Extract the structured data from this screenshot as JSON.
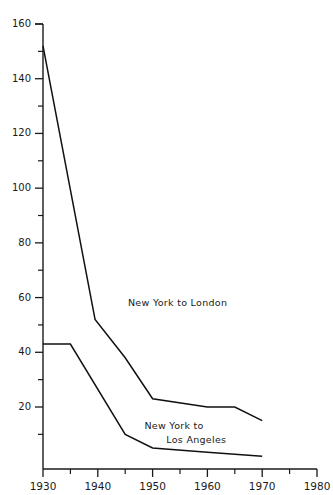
{
  "chart_data": {
    "type": "line",
    "title": "",
    "subtitle": "",
    "xlabel": "",
    "ylabel": "",
    "xlim": [
      1930,
      1980
    ],
    "ylim": [
      0,
      160
    ],
    "grid": false,
    "legend_position": "inline-annotation",
    "x_major_ticks": [
      1930,
      1940,
      1950,
      1960,
      1970,
      1980
    ],
    "x_minor_ticks": [
      1935,
      1945,
      1955,
      1965,
      1975
    ],
    "x_tick_labels": [
      "1930",
      "1940",
      "1950",
      "1960",
      "1970",
      "1980"
    ],
    "y_major_ticks": [
      20,
      40,
      60,
      80,
      100,
      120,
      140,
      160
    ],
    "y_minor_ticks": [
      10,
      30,
      50,
      70,
      90,
      110,
      130,
      150
    ],
    "y_tick_labels": [
      "20",
      "40",
      "60",
      "80",
      "100",
      "120",
      "140",
      "160"
    ],
    "series": [
      {
        "name": "New York to London",
        "label_lines": [
          "New York to London"
        ],
        "color": "#111111",
        "x": [
          1930,
          1939.5,
          1945,
          1950,
          1960,
          1965,
          1970
        ],
        "values": [
          152,
          52,
          38,
          23,
          20,
          20,
          15
        ]
      },
      {
        "name": "New York to Los Angeles",
        "label_lines": [
          "New York to",
          "Los Angeles"
        ],
        "color": "#111111",
        "x": [
          1930,
          1935,
          1945,
          1950,
          1960,
          1970
        ],
        "values": [
          43,
          43,
          10,
          5,
          3.5,
          2
        ]
      }
    ],
    "annotations": [
      {
        "text": "New York to London",
        "x": 1945.5,
        "y": 57
      },
      {
        "text": "New York to",
        "x": 1948.5,
        "y": 12
      },
      {
        "text": "Los Angeles",
        "x": 1952.5,
        "y": 7
      }
    ]
  }
}
